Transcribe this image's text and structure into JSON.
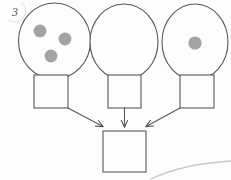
{
  "page": {
    "background_color": "#fdfdfd",
    "width": 231,
    "height": 180,
    "annotation_number": "3"
  },
  "style": {
    "stroke_color": "#585858",
    "stroke_color_light": "#6a6a6a",
    "dot_color": "#a3a3a3",
    "faint_curve_color": "#c9c9c9",
    "fill_color": "#fdfdfd",
    "stroke_width": 1.1
  },
  "diagram": {
    "type": "flow-diagram",
    "title": "",
    "nodes": [
      {
        "id": "balloon-left",
        "kind": "balloon",
        "label": "",
        "dot_count": 3,
        "cx": 54.5,
        "cy": 41,
        "rx": 36,
        "ry": 38,
        "dots": [
          {
            "cx": 40,
            "cy": 31,
            "r": 6.4
          },
          {
            "cx": 65,
            "cy": 39,
            "r": 6.4
          },
          {
            "cx": 51,
            "cy": 56,
            "r": 6.4
          }
        ]
      },
      {
        "id": "balloon-middle",
        "kind": "balloon",
        "label": "",
        "dot_count": 0,
        "cx": 124,
        "cy": 42,
        "rx": 34,
        "ry": 38,
        "dots": []
      },
      {
        "id": "balloon-right",
        "kind": "balloon",
        "label": "",
        "dot_count": 1,
        "cx": 195,
        "cy": 42,
        "rx": 33,
        "ry": 38,
        "dots": [
          {
            "cx": 195,
            "cy": 43,
            "r": 6.6
          }
        ]
      },
      {
        "id": "box-left",
        "kind": "box",
        "label": "",
        "x": 34,
        "y": 75,
        "w": 34,
        "h": 33
      },
      {
        "id": "box-middle",
        "kind": "box",
        "label": "",
        "x": 108,
        "y": 75,
        "w": 33,
        "h": 33
      },
      {
        "id": "box-right",
        "kind": "box",
        "label": "",
        "x": 180,
        "y": 75,
        "w": 34,
        "h": 33
      },
      {
        "id": "box-result",
        "kind": "box",
        "label": "",
        "x": 103,
        "y": 131,
        "w": 43,
        "h": 41
      }
    ],
    "edges": [
      {
        "id": "edge-left-to-result",
        "from": "box-left",
        "to": "box-result",
        "x1": 68,
        "y1": 108,
        "x2": 104,
        "y2": 127,
        "arrowhead": true
      },
      {
        "id": "edge-middle-to-result",
        "from": "box-middle",
        "to": "box-result",
        "x1": 124.5,
        "y1": 108,
        "x2": 124.5,
        "y2": 128,
        "arrowhead": true
      },
      {
        "id": "edge-right-to-result",
        "from": "box-right",
        "to": "box-result",
        "x1": 180,
        "y1": 108,
        "x2": 145,
        "y2": 127,
        "arrowhead": true
      }
    ],
    "decorations": [
      {
        "id": "faint-curve-bottom-right",
        "kind": "curve",
        "d": "M 151 179 C 170 170 196 163 231 161"
      }
    ]
  }
}
